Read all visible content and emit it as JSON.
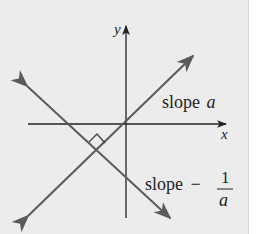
{
  "diagram": {
    "type": "perpendicular-lines",
    "axes": {
      "x_label": "x",
      "y_label": "y"
    },
    "lines": [
      {
        "name": "line-1",
        "label_prefix": "slope",
        "label_var": "a"
      },
      {
        "name": "line-2",
        "label_prefix": "slope",
        "label_sign": "−",
        "label_num": "1",
        "label_den": "a"
      }
    ],
    "annotation": "right-angle marker at intersection",
    "colors": {
      "background": "#ececec",
      "axes": "#222222",
      "lines": "#5a5a5a"
    }
  }
}
